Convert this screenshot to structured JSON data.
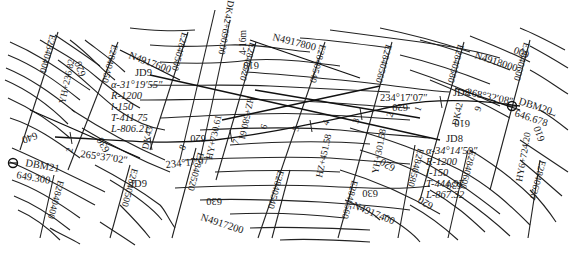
{
  "map": {
    "type": "highway route alignment on topographic contour map",
    "grid_easting_labels": [
      "E2840400",
      "E2840450",
      "E2840500",
      "E2840520",
      "E2840540",
      "E2840560",
      "E2840580",
      "E2840600",
      "E2840620"
    ],
    "grid_east": {
      "e0": "E2840400",
      "e1": "E2840450",
      "e2": "E2840500",
      "e3": "E2840500",
      "e4": "E2840520",
      "e5": "E2840540",
      "e6": "E2840560",
      "e7": "E2840580",
      "e8": "E2840600",
      "e9": "E2840620",
      "e10": "E2840600",
      "e11": "E2840620",
      "e12": "E2840520",
      "e13": "E2840560",
      "e14": "E2840580",
      "e15": "E2840600",
      "e16": "E2840400",
      "e17": "E2840500"
    },
    "grid_north": {
      "n1": "N4917600",
      "n2": "N4917800",
      "n3": "N4918000",
      "n4": "N4917200",
      "n5": "N4917400"
    },
    "contours": {
      "c610a": "610",
      "c610b": "610",
      "c610c": "610",
      "c610d": "610",
      "c620a": "620",
      "c620b": "620",
      "c620c": "620",
      "c620d": "620",
      "c630a": "630",
      "c630b": "630",
      "c630c": "630",
      "c630d": "630",
      "c640": "640",
      "c600": "600"
    },
    "benchmarks": {
      "dbm21": {
        "name": "DBM21",
        "elev": "649.300"
      },
      "dbm20": {
        "name": "DBM20",
        "elev": "646.678"
      }
    },
    "curves": {
      "jd9": {
        "name": "JD9",
        "alpha": "α-31°19′55″",
        "R": "R-1200",
        "l": "l-150",
        "T": "T-411.75",
        "L": "L-806.21"
      },
      "jd8": {
        "name": "JD8",
        "alpha": "α-34°14′59″",
        "R": "R-1200",
        "l": "l-150",
        "T": "T-444.97",
        "L": "L-867.32"
      }
    },
    "bearings": {
      "b1": "265°37′02″",
      "b2": "234°17′07″",
      "b3": "234°17′07″",
      "b4": "268°32′08″"
    },
    "stations": {
      "yh236": "YH+236.82",
      "hy730": "HY+730.61",
      "hz580": "HZ+580.61",
      "hz451": "HZ+451.58",
      "yh301": "YH+301.58",
      "hy6": "HY6+724.20",
      "dk42": "DK42+690.00",
      "dk43": "DK43",
      "dk42b": "DK42",
      "km4": "4-16m"
    },
    "small_marks": {
      "m2a": "2",
      "m3": "3",
      "m4": "4",
      "m5": "5",
      "m6": "6",
      "m7": "7",
      "m8": "8",
      "m9": "9",
      "m1": "1",
      "m2b": "2",
      "m3b": "3",
      "m5b": "5",
      "m1b": "1",
      "m9b": "9",
      "jd9b": "JD9",
      "jd8b": "JD8"
    },
    "colors": {
      "ink": "#1a1a1a",
      "paper": "#ffffff"
    }
  }
}
